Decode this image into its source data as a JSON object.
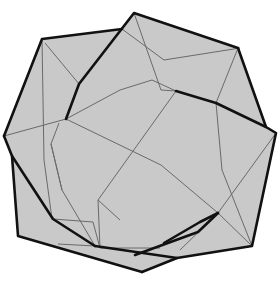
{
  "figure": {
    "title": "",
    "colors": {
      "background": "#ffffff",
      "fill": "#c9c9c9",
      "thin_edge": "#6a6a6a",
      "thick_edge": "#111111"
    },
    "outer_polygon": [
      [
        42,
        39
      ],
      [
        122,
        29
      ],
      [
        134,
        13
      ],
      [
        238,
        48
      ],
      [
        266,
        127
      ],
      [
        276,
        133
      ],
      [
        252,
        246
      ],
      [
        177,
        258
      ],
      [
        142,
        272
      ],
      [
        18,
        236
      ],
      [
        12,
        156
      ],
      [
        4,
        136
      ]
    ],
    "thick_paths": [
      [
        [
          4,
          136
        ],
        [
          42,
          39
        ],
        [
          122,
          29
        ]
      ],
      [
        [
          66,
          119
        ],
        [
          79,
          84
        ],
        [
          134,
          13
        ],
        [
          238,
          48
        ],
        [
          266,
          127
        ],
        [
          276,
          133
        ],
        [
          252,
          246
        ],
        [
          177,
          258
        ],
        [
          142,
          272
        ]
      ],
      [
        [
          142,
          272
        ],
        [
          18,
          236
        ],
        [
          12,
          156
        ],
        [
          4,
          136
        ]
      ],
      [
        [
          12,
          156
        ],
        [
          53,
          219
        ],
        [
          95,
          246
        ]
      ],
      [
        [
          176,
          91
        ],
        [
          216,
          103
        ],
        [
          266,
          127
        ]
      ],
      [
        [
          95,
          246
        ],
        [
          177,
          258
        ]
      ],
      [
        [
          164,
          243
        ],
        [
          200,
          222
        ],
        [
          218,
          213
        ]
      ],
      [
        [
          135,
          255
        ],
        [
          198,
          232
        ],
        [
          218,
          213
        ]
      ]
    ],
    "thin_paths": [
      [
        [
          42,
          39
        ],
        [
          44,
          160
        ],
        [
          52,
          219
        ]
      ],
      [
        [
          45,
          43
        ],
        [
          79,
          84
        ]
      ],
      [
        [
          4,
          136
        ],
        [
          66,
          119
        ],
        [
          120,
          90
        ],
        [
          152,
          80
        ],
        [
          176,
          91
        ]
      ],
      [
        [
          66,
          119
        ],
        [
          161,
          165
        ],
        [
          218,
          213
        ],
        [
          252,
          246
        ]
      ],
      [
        [
          122,
          29
        ],
        [
          164,
          60
        ]
      ],
      [
        [
          134,
          13
        ],
        [
          161,
          90
        ],
        [
          176,
          91
        ]
      ],
      [
        [
          164,
          60
        ],
        [
          240,
          48
        ]
      ],
      [
        [
          238,
          48
        ],
        [
          216,
          103
        ]
      ],
      [
        [
          216,
          103
        ],
        [
          222,
          170
        ],
        [
          252,
          246
        ]
      ],
      [
        [
          176,
          91
        ],
        [
          98,
          200
        ],
        [
          100,
          248
        ]
      ],
      [
        [
          53,
          219
        ],
        [
          93,
          222
        ],
        [
          100,
          248
        ]
      ],
      [
        [
          51,
          144
        ],
        [
          62,
          190
        ],
        [
          95,
          246
        ]
      ],
      [
        [
          62,
          190
        ],
        [
          51,
          144
        ],
        [
          59,
          123
        ]
      ],
      [
        [
          98,
          200
        ],
        [
          120,
          220
        ]
      ],
      [
        [
          276,
          133
        ],
        [
          218,
          213
        ]
      ],
      [
        [
          218,
          213
        ],
        [
          180,
          250
        ]
      ],
      [
        [
          100,
          248
        ],
        [
          160,
          248
        ]
      ],
      [
        [
          58,
          244
        ],
        [
          95,
          246
        ]
      ]
    ]
  }
}
